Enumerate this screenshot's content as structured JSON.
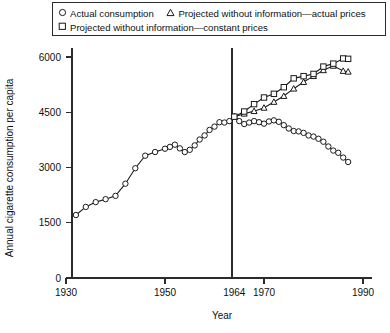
{
  "legend": {
    "rows": [
      [
        {
          "marker": "circle",
          "marker_icon_name": "legend-circle-marker-icon",
          "label": "Actual consumption"
        },
        {
          "marker": "triangle",
          "marker_icon_name": "legend-triangle-marker-icon",
          "label": "Projected without information—actual prices"
        }
      ],
      [
        {
          "marker": "square",
          "marker_icon_name": "legend-square-marker-icon",
          "label": "Projected without information—constant prices"
        }
      ]
    ]
  },
  "chart_data": {
    "type": "line",
    "title": "",
    "xlabel": "Year",
    "ylabel": "Annual cigarette consumption per capita",
    "xlim": [
      1930,
      1990
    ],
    "ylim": [
      0,
      6300
    ],
    "xticks": [
      1930,
      1950,
      1964,
      1970,
      1990
    ],
    "xtick_labels": [
      "1930",
      "1950",
      "1964",
      "1970",
      "1990"
    ],
    "yticks": [
      0,
      1500,
      3000,
      4500,
      6000
    ],
    "ytick_labels": [
      "0",
      "1500",
      "3000",
      "4500",
      "6000"
    ],
    "grid": false,
    "legend_position": "top",
    "annotations": [
      {
        "type": "vline",
        "x": 1964,
        "label": "1964 Surgeon General report"
      }
    ],
    "series": [
      {
        "name": "Actual consumption",
        "marker": "circle",
        "x": [
          1932,
          1934,
          1936,
          1938,
          1940,
          1942,
          1944,
          1946,
          1948,
          1950,
          1951,
          1952,
          1953,
          1954,
          1955,
          1956,
          1957,
          1958,
          1959,
          1960,
          1961,
          1962,
          1963,
          1964,
          1965,
          1966,
          1967,
          1968,
          1969,
          1970,
          1971,
          1972,
          1973,
          1974,
          1975,
          1976,
          1977,
          1978,
          1979,
          1980,
          1981,
          1982,
          1983,
          1984,
          1985,
          1986,
          1987
        ],
        "y": [
          1710,
          1930,
          2060,
          2140,
          2230,
          2560,
          2980,
          3320,
          3420,
          3510,
          3560,
          3620,
          3520,
          3420,
          3480,
          3600,
          3760,
          3870,
          4020,
          4110,
          4230,
          4220,
          4260,
          4380,
          4260,
          4180,
          4220,
          4260,
          4230,
          4190,
          4250,
          4280,
          4240,
          4150,
          4060,
          3990,
          3980,
          3940,
          3870,
          3840,
          3780,
          3700,
          3570,
          3460,
          3400,
          3270,
          3150
        ]
      },
      {
        "name": "Projected without information—actual prices",
        "marker": "triangle",
        "x": [
          1964,
          1966,
          1968,
          1970,
          1972,
          1974,
          1976,
          1978,
          1980,
          1982,
          1984,
          1986,
          1987
        ],
        "y": [
          4380,
          4460,
          4530,
          4620,
          4780,
          4940,
          5140,
          5320,
          5480,
          5640,
          5760,
          5620,
          5600
        ]
      },
      {
        "name": "Projected without information—constant prices",
        "marker": "square",
        "x": [
          1964,
          1966,
          1968,
          1970,
          1972,
          1974,
          1976,
          1978,
          1980,
          1982,
          1984,
          1986,
          1987
        ],
        "y": [
          4380,
          4520,
          4720,
          4900,
          5000,
          5180,
          5420,
          5480,
          5540,
          5740,
          5820,
          5960,
          5950
        ]
      }
    ]
  }
}
